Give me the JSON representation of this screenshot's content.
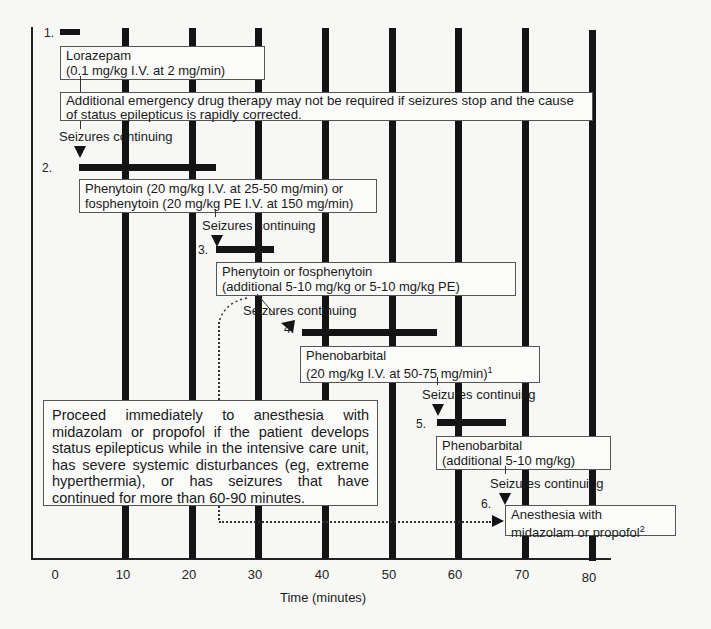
{
  "diagram": {
    "type": "treatment-timeline-flowchart",
    "x_axis": {
      "label": "Time (minutes)",
      "ticks": [
        "0",
        "10",
        "20",
        "30",
        "40",
        "50",
        "60",
        "70",
        "80"
      ]
    },
    "note_top": "Additional emergency drug therapy may not be required if seizures stop and the cause of status epilepticus is rapidly corrected.",
    "note_side": "Proceed immediately to anesthesia with midazolam or propofol if the patient develops status epilepticus while in the intensive care unit, has severe systemic disturbances (eg, extreme hyperthermia), or has seizures that have continued for more than 60-90 minutes.",
    "continue_label": "Seizures continuing",
    "steps": [
      {
        "num": "1.",
        "line1": "Lorazepam",
        "line2": "(0.1 mg/kg I.V. at 2 mg/min)",
        "start_min": 0,
        "end_min": 2
      },
      {
        "num": "2.",
        "line1": "Phenytoin (20 mg/kg I.V. at 25-50 mg/min) or",
        "line2": "fosphenytoin (20 mg/kg PE I.V. at 150 mg/min)",
        "start_min": 3,
        "end_min": 23
      },
      {
        "num": "3.",
        "line1": "Phenytoin or fosphenytoin",
        "line2": "(additional 5-10 mg/kg or 5-10 mg/kg PE)",
        "start_min": 23,
        "end_min": 32
      },
      {
        "num": "4.",
        "line1": "Phenobarbital",
        "line2": "(20 mg/kg I.V. at 50-75 mg/min)",
        "sup": "1",
        "start_min": 36,
        "end_min": 56
      },
      {
        "num": "5.",
        "line1": "Phenobarbital",
        "line2": "(additional 5-10 mg/kg)",
        "start_min": 56,
        "end_min": 67
      },
      {
        "num": "6.",
        "line1": "Anesthesia with",
        "line2": "midazolam or propofol",
        "sup": "2",
        "start_min": 66
      }
    ]
  }
}
